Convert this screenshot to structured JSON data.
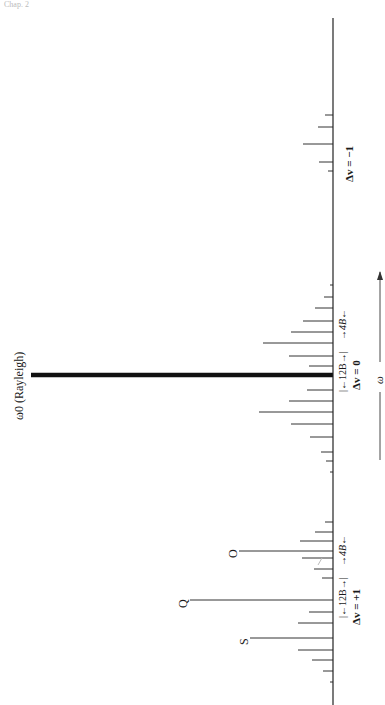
{
  "header": {
    "left_text": "Chap. 2"
  },
  "figure": {
    "orientation": "rotated 90deg counterclockwise",
    "rayleigh_label": "ω0 (Rayleigh)",
    "axis_label": "ω",
    "groups": [
      {
        "name": "dv_minus_1",
        "label": "Δv = −1"
      },
      {
        "name": "dv_zero",
        "label": "Δv = 0",
        "spacing_inner": "12B",
        "spacing_outer": "4B"
      },
      {
        "name": "dv_plus_1",
        "label": "Δv = +1",
        "spacing_inner": "12B",
        "spacing_outer": "4B",
        "branches": [
          "O",
          "Q",
          "S"
        ]
      }
    ]
  },
  "labels": {
    "rayleigh": "ω0 (Rayleigh)",
    "omega": "ω",
    "dv_minus": "Δv = −1",
    "dv_zero": "Δv = 0",
    "dv_plus": "Δv = +1",
    "b12_zero": "|←12B→|",
    "b4_zero": "→4B←",
    "b12_plus": "|←12B→|",
    "b4_plus": "→4B←",
    "branch_o": "O",
    "branch_q": "Q",
    "branch_s": "S"
  },
  "chart_data": {
    "type": "bar",
    "xlabel": "ω",
    "ylabel": "intensity",
    "note": "baseline drawn vertically at x=333; lines extend left; positions are y pixel coordinates",
    "baseline": {
      "x": 333,
      "y_start": 18,
      "y_end": 705
    },
    "lines": [
      {
        "y": 115,
        "x_end": 325
      },
      {
        "y": 127,
        "x_end": 318
      },
      {
        "y": 144,
        "x_end": 303
      },
      {
        "y": 162,
        "x_end": 319
      },
      {
        "y": 171,
        "x_end": 328
      },
      {
        "y": 285,
        "x_end": 330
      },
      {
        "y": 297,
        "x_end": 324
      },
      {
        "y": 308,
        "x_end": 315
      },
      {
        "y": 321,
        "x_end": 303
      },
      {
        "y": 332,
        "x_end": 291
      },
      {
        "y": 343,
        "x_end": 263
      },
      {
        "y": 356,
        "x_end": 289
      },
      {
        "y": 366,
        "x_end": 309
      },
      {
        "y": 375,
        "x_end": 31,
        "thick": true
      },
      {
        "y": 390,
        "x_end": 307
      },
      {
        "y": 401,
        "x_end": 289
      },
      {
        "y": 412,
        "x_end": 259
      },
      {
        "y": 424,
        "x_end": 291
      },
      {
        "y": 437,
        "x_end": 310
      },
      {
        "y": 452,
        "x_end": 321
      },
      {
        "y": 461,
        "x_end": 326
      },
      {
        "y": 472,
        "x_end": 330
      },
      {
        "y": 522,
        "x_end": 325
      },
      {
        "y": 532,
        "x_end": 315
      },
      {
        "y": 541,
        "x_end": 300
      },
      {
        "y": 551,
        "x_end": 279
      },
      {
        "y": 558,
        "x_end": 302
      },
      {
        "y": 569,
        "x_end": 314
      },
      {
        "y": 578,
        "x_end": 322
      },
      {
        "y": 600,
        "x_end": 218
      },
      {
        "y": 612,
        "x_end": 309
      },
      {
        "y": 623,
        "x_end": 298
      },
      {
        "y": 638,
        "x_end": 279
      },
      {
        "y": 650,
        "x_end": 298
      },
      {
        "y": 660,
        "x_end": 312
      },
      {
        "y": 671,
        "x_end": 323
      },
      {
        "y": 682,
        "x_end": 330
      }
    ]
  }
}
